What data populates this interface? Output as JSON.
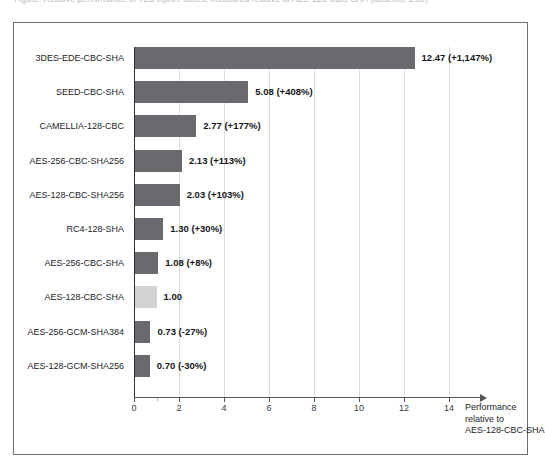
{
  "caption": {
    "text": "Figure: Relative performance of TLS cipher suites, measured relative to AES-128-CBC-SHA (baseline 1.00)"
  },
  "chart_data": {
    "type": "bar",
    "orientation": "horizontal",
    "title": "",
    "xlabel": "Performance relative to AES-128-CBC-SHA",
    "ylabel": "",
    "xlim": [
      0,
      15
    ],
    "grid": true,
    "legend": "none",
    "xticks": [
      "0",
      "2",
      "4",
      "6",
      "8",
      "10",
      "12",
      "14"
    ],
    "xtick_values": [
      0,
      2,
      4,
      6,
      8,
      10,
      12,
      14
    ],
    "minor_tick_values": [
      1
    ],
    "categories": [
      "3DES-EDE-CBC-SHA",
      "SEED-CBC-SHA",
      "CAMELLIA-128-CBC",
      "AES-256-CBC-SHA256",
      "AES-128-CBC-SHA256",
      "RC4-128-SHA",
      "AES-256-CBC-SHA",
      "AES-128-CBC-SHA",
      "AES-256-GCM-SHA384",
      "AES-128-GCM-SHA256"
    ],
    "values": [
      12.47,
      5.08,
      2.77,
      2.13,
      2.03,
      1.3,
      1.08,
      1.0,
      0.73,
      0.7
    ],
    "data_labels": [
      "12.47 (+1,147%)",
      "5.08 (+408%)",
      "2.77 (+177%)",
      "2.13 (+113%)",
      "2.03 (+103%)",
      "1.30 (+30%)",
      "1.08 (+8%)",
      "1.00",
      "0.73 (-27%)",
      "0.70 (-30%)"
    ],
    "percent_change": [
      1147,
      408,
      177,
      113,
      103,
      30,
      8,
      0,
      -27,
      -30
    ],
    "baseline_category": "AES-128-CBC-SHA",
    "baseline_value": 1.0,
    "colors": {
      "bar": "#6a6a6e",
      "baseline_bar": "#d2d2d4",
      "axis": "#55555a",
      "gridline": "#dcdcdf",
      "frame": "#6e6e72",
      "text": "#232327"
    }
  },
  "axis_caption": {
    "line1": "Performance",
    "line2": "relative to",
    "line3": "AES-128-CBC-SHA"
  }
}
